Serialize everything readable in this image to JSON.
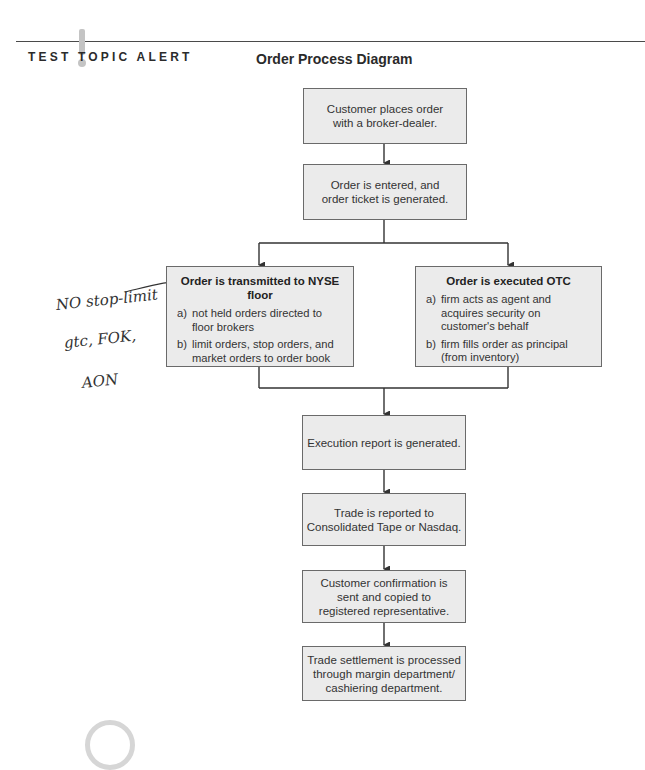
{
  "header": {
    "alert_label": "TEST TOPIC ALERT",
    "alert_icon": "exclamation-icon",
    "title": "Order Process Diagram"
  },
  "boxes": {
    "step1": {
      "lines": [
        "Customer places order",
        "with a broker-dealer."
      ]
    },
    "step2": {
      "lines": [
        "Order is entered, and",
        "order ticket is generated."
      ]
    },
    "nyse": {
      "heading": "Order is transmitted to NYSE floor",
      "items": [
        {
          "marker": "a)",
          "text": "not held orders directed to floor brokers"
        },
        {
          "marker": "b)",
          "text": "limit orders, stop orders, and market orders to order book"
        }
      ]
    },
    "otc": {
      "heading": "Order is executed OTC",
      "items": [
        {
          "marker": "a)",
          "text": "firm acts as agent and acquires security on customer's behalf"
        },
        {
          "marker": "b)",
          "text": "firm fills order as principal (from inventory)"
        }
      ]
    },
    "step3": {
      "lines": [
        "Execution report is generated."
      ]
    },
    "step4": {
      "lines": [
        "Trade is reported to",
        "Consolidated Tape or Nasdaq."
      ]
    },
    "step5": {
      "lines": [
        "Customer confirmation is",
        "sent and copied to",
        "registered representative."
      ]
    },
    "step6": {
      "lines": [
        "Trade settlement is processed",
        "through margin department/",
        "cashiering department."
      ]
    }
  },
  "annotations": {
    "handwritten": [
      "NO stop-limit",
      "gtc, FOK,",
      "AON"
    ],
    "underlined_word": "NYSE"
  },
  "colors": {
    "box_fill": "#ebebeb",
    "box_border": "#6a6a6a",
    "connector": "#333333",
    "alert_icon": "#c4c4c4"
  }
}
